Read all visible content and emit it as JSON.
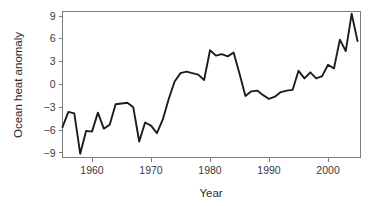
{
  "chart_data": {
    "type": "line",
    "title": "",
    "xlabel": "Year",
    "ylabel": "Ocean heat anomaly",
    "xlim": [
      1955,
      2005.5
    ],
    "ylim": [
      -9.6,
      9.6
    ],
    "xticks": [
      1960,
      1970,
      1980,
      1990,
      2000
    ],
    "xtick_labels": [
      "1960",
      "1970",
      "1980",
      "1990",
      "2000"
    ],
    "yticks": [
      -9,
      -6,
      -3,
      0,
      3,
      6,
      9
    ],
    "ytick_labels": [
      "-9",
      "-6",
      "-3",
      "0",
      "3",
      "6",
      "9"
    ],
    "grid": false,
    "legend": false,
    "series": [
      {
        "name": "Ocean heat anomaly",
        "color": "#1d1d1d",
        "x": [
          1955,
          1956,
          1957,
          1958,
          1959,
          1960,
          1961,
          1962,
          1963,
          1964,
          1965,
          1966,
          1967,
          1968,
          1969,
          1970,
          1971,
          1972,
          1973,
          1974,
          1975,
          1976,
          1977,
          1978,
          1979,
          1980,
          1981,
          1982,
          1983,
          1984,
          1985,
          1986,
          1987,
          1988,
          1989,
          1990,
          1991,
          1992,
          1993,
          1994,
          1995,
          1996,
          1997,
          1998,
          1999,
          2000,
          2001,
          2002,
          2003,
          2004,
          2005
        ],
        "values": [
          -5.6,
          -3.6,
          -3.8,
          -9.1,
          -6.1,
          -6.2,
          -3.7,
          -5.8,
          -5.3,
          -2.6,
          -2.5,
          -2.4,
          -3.0,
          -7.5,
          -5.0,
          -5.4,
          -6.4,
          -4.6,
          -1.9,
          0.4,
          1.5,
          1.7,
          1.5,
          1.3,
          0.6,
          4.5,
          3.8,
          4.0,
          3.7,
          4.2,
          1.4,
          -1.5,
          -0.9,
          -0.8,
          -1.4,
          -1.9,
          -1.6,
          -1.0,
          -0.8,
          -0.7,
          1.8,
          0.8,
          1.6,
          0.8,
          1.1,
          2.6,
          2.1,
          5.9,
          4.4,
          9.3,
          5.7
        ]
      }
    ]
  },
  "axis": {
    "ylabel_text": "Ocean heat anomaly",
    "xlabel_text": "Year"
  }
}
